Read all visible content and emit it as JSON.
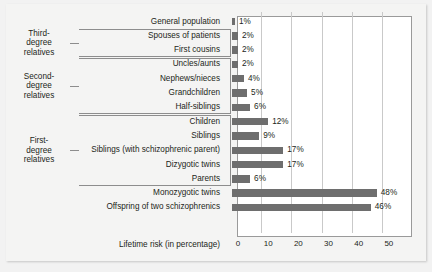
{
  "chart_data": {
    "type": "bar",
    "orientation": "horizontal",
    "title": "",
    "xlabel": "Lifetime risk (in percentage)",
    "ylabel": "",
    "xlim": [
      0,
      58
    ],
    "xticks": [
      0,
      10,
      20,
      30,
      40,
      50
    ],
    "grid": true,
    "legend": null,
    "categories": [
      "General population",
      "Spouses of patients",
      "First cousins",
      "Uncles/aunts",
      "Nephews/nieces",
      "Grandchildren",
      "Half-siblings",
      "Children",
      "Siblings",
      "Siblings (with schizophrenic parent)",
      "Dizygotic twins",
      "Parents",
      "Monozygotic twins",
      "Offspring of two schizophrenics"
    ],
    "values": [
      1,
      2,
      2,
      2,
      4,
      5,
      6,
      12,
      9,
      17,
      17,
      6,
      48,
      46
    ],
    "value_labels": [
      "1%",
      "2%",
      "2%",
      "2%",
      "4%",
      "5%",
      "6%",
      "12%",
      "9%",
      "17%",
      "17%",
      "6%",
      "48%",
      "46%"
    ],
    "bar_color": "#6e6e6e",
    "plot_background": "#ffffff",
    "figure_background": "#f4f4f3",
    "annotations": [
      {
        "label": "Third-degree relatives",
        "label_lines": [
          "Third-",
          "degree",
          "relatives"
        ],
        "covers": [
          "Spouses of patients",
          "First cousins"
        ]
      },
      {
        "label": "Second-degree relatives",
        "label_lines": [
          "Second-",
          "degree",
          "relatives"
        ],
        "covers": [
          "Uncles/aunts",
          "Nephews/nieces",
          "Grandchildren",
          "Half-siblings"
        ]
      },
      {
        "label": "First-degree relatives",
        "label_lines": [
          "First-",
          "degree",
          "relatives"
        ],
        "covers": [
          "Children",
          "Siblings",
          "Siblings (with schizophrenic parent)",
          "Dizygotic twins",
          "Parents"
        ]
      }
    ]
  },
  "axis": {
    "title": "Lifetime risk (in percentage)",
    "ticks": [
      "0",
      "10",
      "20",
      "30",
      "40",
      "50"
    ]
  },
  "groups": {
    "third": {
      "line1": "Third-",
      "line2": "degree",
      "line3": "relatives"
    },
    "second": {
      "line1": "Second-",
      "line2": "degree",
      "line3": "relatives"
    },
    "first": {
      "line1": "First-",
      "line2": "degree",
      "line3": "relatives"
    }
  }
}
